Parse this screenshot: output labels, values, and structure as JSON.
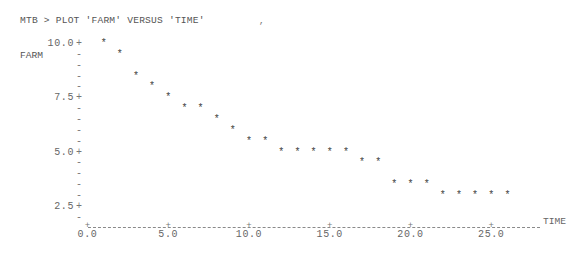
{
  "terminal": {
    "command_line": "MTB > PLOT 'FARM' VERSUS 'TIME'",
    "stray_mark": ","
  },
  "chart_data": {
    "type": "scatter",
    "title": "MTB > PLOT 'FARM' VERSUS 'TIME'",
    "xlabel": "TIME",
    "ylabel": "FARM",
    "xlim": [
      0.0,
      27.5
    ],
    "ylim": [
      1.5,
      10.0
    ],
    "x_ticks": [
      "0.0",
      "5.0",
      "10.0",
      "15.0",
      "20.0",
      "25.0"
    ],
    "y_ticks": [
      "10.0",
      "7.5",
      "5.0",
      "2.5"
    ],
    "marker": "*",
    "grid": false,
    "legend": null,
    "x": [
      1,
      2,
      3,
      4,
      5,
      6,
      7,
      8,
      9,
      10,
      11,
      12,
      13,
      14,
      15,
      16,
      17,
      18,
      19,
      20,
      21,
      22,
      23,
      24,
      25,
      26
    ],
    "y": [
      10.0,
      9.5,
      8.5,
      8.0,
      7.5,
      7.0,
      7.0,
      6.5,
      6.0,
      5.5,
      5.5,
      5.0,
      5.0,
      5.0,
      5.0,
      5.0,
      4.5,
      4.5,
      3.5,
      3.5,
      3.5,
      3.0,
      3.0,
      3.0,
      3.0,
      3.0
    ]
  },
  "axis": {
    "y_tick_values": [
      10.0,
      7.5,
      5.0,
      2.5
    ],
    "y_minor_rows": [
      9.5,
      9.0,
      8.5,
      8.0,
      7.0,
      6.5,
      6.0,
      5.5,
      4.5,
      4.0,
      3.5,
      3.0,
      2.0
    ],
    "x_tick_values": [
      0,
      5,
      10,
      15,
      20,
      25
    ],
    "plus_glyph": "+",
    "minus_glyph": "-"
  },
  "colors": {
    "text": "#5a5a5a",
    "points": "#444444",
    "background": "#ffffff"
  }
}
